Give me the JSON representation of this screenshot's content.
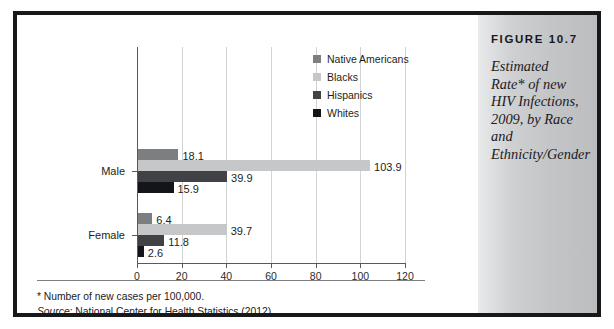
{
  "figure": {
    "number_label": "FIGURE 10.7",
    "caption": "Estimated Rate* of new HIV Infections, 2009, by Race and Ethnicity/Gender"
  },
  "notes": {
    "footnote": "*  Number of new cases per 100,000.",
    "source_label": "Source",
    "source_text": ": National Center for Health Statistics (2012)."
  },
  "legend": {
    "items": [
      {
        "label": "Native Americans",
        "color": "#7d7e80"
      },
      {
        "label": "Blacks",
        "color": "#c6c7c9"
      },
      {
        "label": "Hispanics",
        "color": "#414245"
      },
      {
        "label": "Whites",
        "color": "#141518"
      }
    ]
  },
  "chart_data": {
    "type": "bar",
    "orientation": "horizontal",
    "title": "Estimated Rate* of new HIV Infections, 2009, by Race and Ethnicity/Gender",
    "xlabel": "",
    "ylabel": "",
    "xlim": [
      0,
      120
    ],
    "xticks": [
      0,
      20,
      40,
      60,
      80,
      100,
      120
    ],
    "grid": true,
    "legend_position": "top-right",
    "categories": [
      "Male",
      "Female"
    ],
    "series": [
      {
        "name": "Native Americans",
        "color": "#7d7e80",
        "values": [
          18.1,
          6.4
        ]
      },
      {
        "name": "Blacks",
        "color": "#c6c7c9",
        "values": [
          103.9,
          39.7
        ]
      },
      {
        "name": "Hispanics",
        "color": "#414245",
        "values": [
          39.9,
          11.8
        ]
      },
      {
        "name": "Whites",
        "color": "#141518",
        "values": [
          15.9,
          2.6
        ]
      }
    ]
  }
}
